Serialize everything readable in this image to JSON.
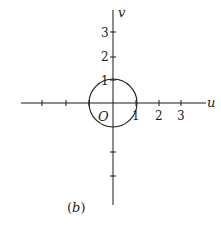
{
  "diagram": {
    "panel_label": "(b)",
    "axes": {
      "u_label": "u",
      "v_label": "v",
      "origin_label": "O"
    },
    "u_ticks": [
      {
        "value": -3,
        "label": ""
      },
      {
        "value": -2,
        "label": ""
      },
      {
        "value": -1,
        "label": ""
      },
      {
        "value": 1,
        "label": "1"
      },
      {
        "value": 2,
        "label": "2"
      },
      {
        "value": 3,
        "label": "3"
      }
    ],
    "v_ticks": [
      {
        "value": 3,
        "label": "3"
      },
      {
        "value": 2,
        "label": "2"
      },
      {
        "value": 1,
        "label": "1"
      },
      {
        "value": -1,
        "label": ""
      },
      {
        "value": -2,
        "label": ""
      },
      {
        "value": -3,
        "label": ""
      }
    ],
    "shapes": [
      {
        "type": "circle",
        "center": [
          0,
          0
        ],
        "radius": 1,
        "description": "unit circle"
      }
    ],
    "colors": {
      "stroke": "#1a1a1a",
      "background": "#ffffff"
    }
  }
}
